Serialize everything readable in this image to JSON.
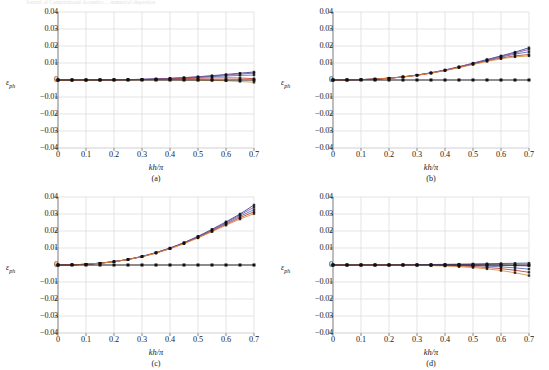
{
  "figure": {
    "top_cropped_text": "Journal of Computational Acoustics ... numerical dispersion",
    "panel_count": 4
  },
  "axis": {
    "x_title_num": "kh",
    "x_title_den": "π",
    "y_title_symbol": "ε",
    "y_title_sub": "ph",
    "xticks": [
      "0",
      "0.1",
      "0.2",
      "0.3",
      "0.4",
      "0.5",
      "0.6",
      "0.7"
    ],
    "yticks": [
      "0.04",
      "0.03",
      "0.02",
      "0.01",
      "0",
      "-0.01",
      "-0.02",
      "-0.03",
      "-0.04"
    ],
    "xlim": [
      0,
      0.7
    ],
    "ylim": [
      -0.04,
      0.04
    ],
    "grid": true
  },
  "tags": {
    "a": "(a)",
    "b": "(b)",
    "c": "(c)",
    "d": "(d)"
  },
  "colors": {
    "navy": "#3a3f8f",
    "purple": "#7b4f9d",
    "blue": "#5566b5",
    "red": "#c0392b",
    "orange": "#d98a3a",
    "black": "#111111",
    "grid": "#d9d9dd",
    "axis": "#9a9a9a"
  },
  "chart_data": [
    {
      "type": "line",
      "title": "(a)",
      "xlabel": "kh/π",
      "ylabel": "ε_ph",
      "xlim": [
        0,
        0.7
      ],
      "ylim": [
        -0.04,
        0.04
      ],
      "grid": true,
      "legend": "none",
      "x": [
        0,
        0.05,
        0.1,
        0.15,
        0.2,
        0.25,
        0.3,
        0.35,
        0.4,
        0.45,
        0.5,
        0.55,
        0.6,
        0.65,
        0.7
      ],
      "series": [
        {
          "name": "series-1",
          "color": "#3a3f8f",
          "values": [
            0,
            0,
            2e-05,
            5e-05,
            0.00012,
            0.00023,
            0.0004,
            0.00065,
            0.00098,
            0.0014,
            0.00192,
            0.00254,
            0.00325,
            0.00402,
            0.0047
          ]
        },
        {
          "name": "series-2",
          "color": "#7b4f9d",
          "values": [
            0,
            0,
            2e-05,
            5e-05,
            0.00011,
            0.00021,
            0.00037,
            0.0006,
            0.00091,
            0.0013,
            0.00178,
            0.00233,
            0.00295,
            0.00355,
            0.004
          ]
        },
        {
          "name": "series-3",
          "color": "#5566b5",
          "values": [
            0,
            0,
            1e-05,
            4e-05,
            0.0001,
            0.00019,
            0.00033,
            0.00053,
            0.0008,
            0.00113,
            0.00152,
            0.00194,
            0.00236,
            0.00272,
            0.0029
          ]
        },
        {
          "name": "series-4",
          "color": "#c0392b",
          "values": [
            0,
            0,
            1e-05,
            3e-05,
            8e-05,
            0.00015,
            0.00026,
            0.00041,
            0.00059,
            0.0008,
            0.00101,
            0.00118,
            0.00126,
            0.00116,
            0.0008
          ]
        },
        {
          "name": "series-5",
          "color": "#d98a3a",
          "values": [
            0,
            0,
            0,
            1e-05,
            3e-05,
            6e-05,
            0.0001,
            0.00013,
            0.00014,
            0.0001,
            0.0,
            -0.00018,
            -0.00046,
            -0.00086,
            -0.00135
          ]
        },
        {
          "name": "reference-zero",
          "color": "#111111",
          "values": [
            0,
            0,
            0,
            0,
            0,
            0,
            0,
            0,
            0,
            0,
            0,
            0,
            0,
            0,
            0
          ]
        }
      ]
    },
    {
      "type": "line",
      "title": "(b)",
      "xlabel": "kh/π",
      "ylabel": "ε_ph",
      "xlim": [
        0,
        0.7
      ],
      "ylim": [
        -0.04,
        0.04
      ],
      "grid": true,
      "legend": "none",
      "x": [
        0,
        0.05,
        0.1,
        0.15,
        0.2,
        0.25,
        0.3,
        0.35,
        0.4,
        0.45,
        0.5,
        0.55,
        0.6,
        0.65,
        0.7
      ],
      "series": [
        {
          "name": "series-1",
          "color": "#3a3f8f",
          "values": [
            0,
            5e-05,
            0.00022,
            0.00055,
            0.00108,
            0.00185,
            0.0029,
            0.00425,
            0.0059,
            0.0078,
            0.0099,
            0.01205,
            0.0142,
            0.0164,
            0.019
          ]
        },
        {
          "name": "series-2",
          "color": "#7b4f9d",
          "values": [
            0,
            5e-05,
            0.00022,
            0.00055,
            0.00107,
            0.00183,
            0.00287,
            0.0042,
            0.00583,
            0.0077,
            0.00975,
            0.01185,
            0.0139,
            0.0159,
            0.018
          ]
        },
        {
          "name": "series-3",
          "color": "#5566b5",
          "values": [
            0,
            5e-05,
            0.00021,
            0.00054,
            0.00105,
            0.0018,
            0.00282,
            0.00412,
            0.00572,
            0.00755,
            0.00955,
            0.01158,
            0.0135,
            0.0152,
            0.0166
          ]
        },
        {
          "name": "series-4",
          "color": "#c0392b",
          "values": [
            0,
            5e-05,
            0.00021,
            0.00053,
            0.00104,
            0.00178,
            0.00278,
            0.00406,
            0.00562,
            0.0074,
            0.00932,
            0.01122,
            0.01292,
            0.0142,
            0.015
          ]
        },
        {
          "name": "series-5",
          "color": "#d98a3a",
          "values": [
            0,
            5e-05,
            0.00021,
            0.00053,
            0.00103,
            0.00176,
            0.00275,
            0.004,
            0.00553,
            0.00727,
            0.00912,
            0.01092,
            0.01248,
            0.0136,
            0.0142
          ]
        },
        {
          "name": "reference-zero",
          "color": "#111111",
          "values": [
            0,
            0,
            0,
            0,
            0,
            0,
            0,
            0,
            0,
            0,
            0,
            0,
            0,
            0,
            0
          ]
        }
      ]
    },
    {
      "type": "line",
      "title": "(c)",
      "xlabel": "kh/π",
      "ylabel": "ε_ph",
      "xlim": [
        0,
        0.7
      ],
      "ylim": [
        -0.04,
        0.04
      ],
      "grid": true,
      "legend": "none",
      "x": [
        0,
        0.05,
        0.1,
        0.15,
        0.2,
        0.25,
        0.3,
        0.35,
        0.4,
        0.45,
        0.5,
        0.55,
        0.6,
        0.65,
        0.7
      ],
      "series": [
        {
          "name": "series-1",
          "color": "#3a3f8f",
          "values": [
            0,
            0.0001,
            0.00045,
            0.00108,
            0.002,
            0.0033,
            0.00505,
            0.0073,
            0.01,
            0.0132,
            0.0169,
            0.021,
            0.0254,
            0.03,
            0.0353
          ]
        },
        {
          "name": "series-2",
          "color": "#7b4f9d",
          "values": [
            0,
            0.0001,
            0.00045,
            0.00107,
            0.00198,
            0.00327,
            0.005,
            0.00722,
            0.0099,
            0.01305,
            0.01668,
            0.0207,
            0.025,
            0.0294,
            0.034
          ]
        },
        {
          "name": "series-3",
          "color": "#5566b5",
          "values": [
            0,
            0.0001,
            0.00044,
            0.00106,
            0.00196,
            0.00324,
            0.00495,
            0.00714,
            0.00978,
            0.01288,
            0.01642,
            0.02032,
            0.02448,
            0.0286,
            0.0326
          ]
        },
        {
          "name": "series-4",
          "color": "#c0392b",
          "values": [
            0,
            0.0001,
            0.00044,
            0.00105,
            0.00195,
            0.00321,
            0.0049,
            0.00706,
            0.00966,
            0.0127,
            0.01616,
            0.01995,
            0.02392,
            0.0278,
            0.0313
          ]
        },
        {
          "name": "series-5",
          "color": "#d98a3a",
          "values": [
            0,
            0.0001,
            0.00044,
            0.00104,
            0.00193,
            0.00318,
            0.00485,
            0.00698,
            0.00954,
            0.01252,
            0.0159,
            0.01958,
            0.0234,
            0.027,
            0.0302
          ]
        },
        {
          "name": "reference-zero",
          "color": "#111111",
          "values": [
            0,
            0,
            0,
            0,
            0,
            0,
            0,
            0,
            0,
            0,
            0,
            0,
            0,
            0,
            0
          ]
        }
      ]
    },
    {
      "type": "line",
      "title": "(d)",
      "xlabel": "kh/π",
      "ylabel": "ε_ph",
      "xlim": [
        0,
        0.7
      ],
      "ylim": [
        -0.04,
        0.04
      ],
      "grid": true,
      "legend": "none",
      "x": [
        0,
        0.05,
        0.1,
        0.15,
        0.2,
        0.25,
        0.3,
        0.35,
        0.4,
        0.45,
        0.5,
        0.55,
        0.6,
        0.65,
        0.7
      ],
      "series": [
        {
          "name": "series-1",
          "color": "#3a3f8f",
          "values": [
            0,
            0,
            1e-05,
            3e-05,
            6e-05,
            0.00011,
            0.00018,
            0.00027,
            0.00038,
            0.0005,
            0.00063,
            0.00077,
            0.0009,
            0.00101,
            0.0011
          ]
        },
        {
          "name": "series-2",
          "color": "#7b4f9d",
          "values": [
            0,
            0,
            1e-05,
            2e-05,
            4e-05,
            7e-05,
            0.00011,
            0.00015,
            0.00018,
            0.00019,
            0.00016,
            8e-05,
            -8e-05,
            -0.0003,
            -0.0006
          ]
        },
        {
          "name": "series-3",
          "color": "#5566b5",
          "values": [
            0,
            0,
            0,
            1e-05,
            2e-05,
            3e-05,
            3e-05,
            1e-05,
            -4e-05,
            -0.00015,
            -0.00034,
            -0.00064,
            -0.00108,
            -0.00168,
            -0.00245
          ]
        },
        {
          "name": "series-4",
          "color": "#c0392b",
          "values": [
            0,
            0,
            0,
            0,
            -1e-05,
            -3e-05,
            -8e-05,
            -0.00017,
            -0.00032,
            -0.00056,
            -0.00092,
            -0.00143,
            -0.00214,
            -0.00308,
            -0.0043
          ]
        },
        {
          "name": "series-5",
          "color": "#d98a3a",
          "values": [
            0,
            0,
            0,
            -1e-05,
            -3e-05,
            -8e-05,
            -0.00018,
            -0.00034,
            -0.0006,
            -0.00098,
            -0.00152,
            -0.00226,
            -0.00326,
            -0.00455,
            -0.0062
          ]
        },
        {
          "name": "reference-zero",
          "color": "#111111",
          "values": [
            0,
            0,
            0,
            0,
            0,
            0,
            0,
            0,
            0,
            0,
            0,
            0,
            0,
            0,
            0
          ]
        }
      ]
    }
  ]
}
